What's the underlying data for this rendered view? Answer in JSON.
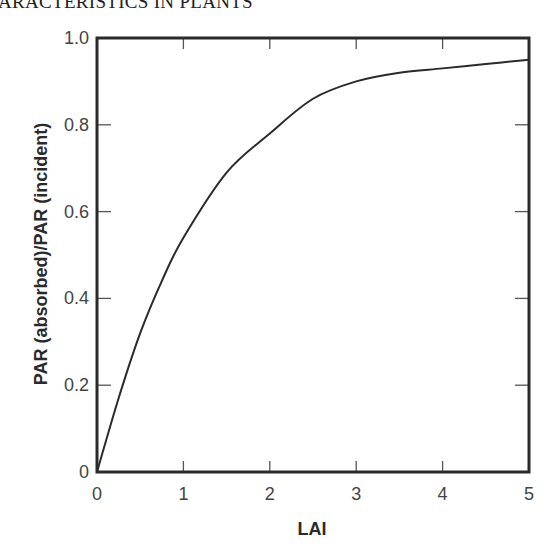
{
  "page": {
    "running_head": "ARACTERISTICS IN PLANTS"
  },
  "chart_data": {
    "type": "line",
    "title": "",
    "xlabel": "LAI",
    "ylabel": "PAR (absorbed)/PAR (incident)",
    "xlim": [
      0,
      5
    ],
    "ylim": [
      0,
      1.0
    ],
    "x_ticks": [
      "0",
      "1",
      "2",
      "3",
      "4",
      "5"
    ],
    "y_ticks": [
      "0",
      "0.2",
      "0.4",
      "0.6",
      "0.8",
      "1.0"
    ],
    "grid": false,
    "legend": null,
    "frame": "box with inward ticks on all four sides",
    "series": [
      {
        "name": "PAR absorbed fraction",
        "x": [
          0,
          0.25,
          0.5,
          0.75,
          1,
          1.5,
          2,
          2.5,
          3,
          3.5,
          4,
          4.5,
          5
        ],
        "values": [
          0,
          0.17,
          0.32,
          0.44,
          0.54,
          0.69,
          0.78,
          0.86,
          0.9,
          0.92,
          0.93,
          0.94,
          0.95
        ]
      }
    ],
    "colors": {
      "line": "#2a2a2a",
      "frame": "#2a2a2a",
      "ticks": "#555555"
    }
  }
}
